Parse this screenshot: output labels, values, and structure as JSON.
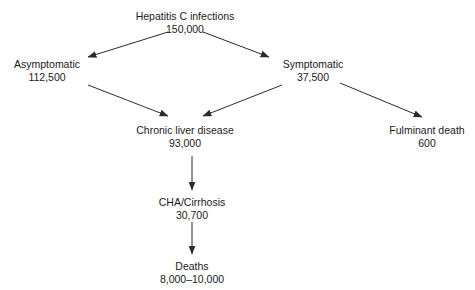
{
  "diagram": {
    "colors": {
      "background": "#ffffff",
      "text": "#1a1a1a",
      "edge": "#2b2b2b"
    },
    "nodes": [
      {
        "id": "hepatitis-c-infections",
        "label": "Hepatitis C infections",
        "value": "150,000",
        "x": 185,
        "y": 10
      },
      {
        "id": "asymptomatic",
        "label": "Asymptomatic",
        "value": "112,500",
        "x": 47,
        "y": 58
      },
      {
        "id": "symptomatic",
        "label": "Symptomatic",
        "value": "37,500",
        "x": 313,
        "y": 58
      },
      {
        "id": "chronic-liver-disease",
        "label": "Chronic liver disease",
        "value": "93,000",
        "x": 185,
        "y": 124
      },
      {
        "id": "fulminant-death",
        "label": "Fulminant death",
        "value": "600",
        "x": 427,
        "y": 124
      },
      {
        "id": "cha-cirrhosis",
        "label": "CHA/Cirrhosis",
        "value": "30,700",
        "x": 192,
        "y": 196
      },
      {
        "id": "deaths",
        "label": "Deaths",
        "value": "8,000–10,000",
        "x": 192,
        "y": 260
      }
    ],
    "edges": [
      {
        "id": "infections-to-asymptomatic",
        "from": "hepatitis-c-infections",
        "to": "asymptomatic",
        "x1": 168,
        "y1": 32,
        "x2": 88,
        "y2": 57
      },
      {
        "id": "infections-to-symptomatic",
        "from": "hepatitis-c-infections",
        "to": "symptomatic",
        "x1": 203,
        "y1": 32,
        "x2": 269,
        "y2": 57
      },
      {
        "id": "asymptomatic-to-chronic-liver-disease",
        "from": "asymptomatic",
        "to": "chronic-liver-disease",
        "x1": 88,
        "y1": 85,
        "x2": 168,
        "y2": 116
      },
      {
        "id": "symptomatic-to-chronic-liver-disease",
        "from": "symptomatic",
        "to": "chronic-liver-disease",
        "x1": 282,
        "y1": 85,
        "x2": 203,
        "y2": 116
      },
      {
        "id": "symptomatic-to-fulminant-death",
        "from": "symptomatic",
        "to": "fulminant-death",
        "x1": 340,
        "y1": 83,
        "x2": 422,
        "y2": 117
      },
      {
        "id": "chronic-liver-disease-to-cha-cirrhosis",
        "from": "chronic-liver-disease",
        "to": "cha-cirrhosis",
        "x1": 192,
        "y1": 156,
        "x2": 192,
        "y2": 190
      },
      {
        "id": "cha-cirrhosis-to-deaths",
        "from": "cha-cirrhosis",
        "to": "deaths",
        "x1": 192,
        "y1": 222,
        "x2": 192,
        "y2": 254
      }
    ]
  }
}
